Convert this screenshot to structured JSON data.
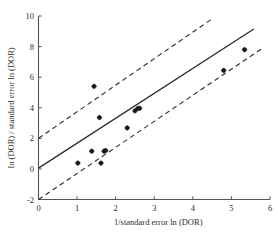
{
  "chart_data": {
    "type": "scatter",
    "title": "",
    "subtitle": "",
    "xlabel": "1/standard error ln (DOR)",
    "ylabel": "ln (DOR) / standard error ln (DOR)",
    "xlim": [
      0,
      6
    ],
    "ylim": [
      -2,
      10
    ],
    "xticks": [
      0,
      1,
      2,
      3,
      4,
      5,
      6
    ],
    "xticklabels": [
      "0",
      "1",
      "2",
      "3",
      "4",
      "5",
      "6"
    ],
    "yticks": [
      -2,
      0,
      2,
      4,
      6,
      8,
      10
    ],
    "yticklabels": [
      "-2",
      "0",
      "2",
      "4",
      "6",
      "8",
      "10"
    ],
    "grid": false,
    "legend": null,
    "points": [
      {
        "x": 1.02,
        "y": 0.38
      },
      {
        "x": 1.38,
        "y": 1.16
      },
      {
        "x": 1.44,
        "y": 5.4
      },
      {
        "x": 1.58,
        "y": 3.36
      },
      {
        "x": 1.62,
        "y": 0.38
      },
      {
        "x": 1.7,
        "y": 1.16
      },
      {
        "x": 1.74,
        "y": 1.2
      },
      {
        "x": 2.3,
        "y": 2.68
      },
      {
        "x": 2.5,
        "y": 3.8
      },
      {
        "x": 2.57,
        "y": 3.95
      },
      {
        "x": 2.62,
        "y": 3.96
      },
      {
        "x": 4.8,
        "y": 6.44
      },
      {
        "x": 5.34,
        "y": 7.8
      }
    ],
    "lines": [
      {
        "name": "regression-line",
        "style": "solid",
        "intercept": 0.05,
        "slope": 1.63,
        "x_start": 0.0,
        "y_start": 0.05,
        "x_end": 5.58,
        "y_end": 9.15
      },
      {
        "name": "upper-confidence-line",
        "style": "dashed",
        "intercept": 2.0,
        "slope": 1.63,
        "x_start": 0.0,
        "y_start": 2.0,
        "x_end": 4.52,
        "y_end": 9.85
      },
      {
        "name": "lower-confidence-line",
        "style": "dashed",
        "intercept": -2.0,
        "slope": 1.63,
        "x_start": 0.0,
        "y_start": -2.0,
        "x_end": 5.78,
        "y_end": 7.85
      }
    ]
  }
}
